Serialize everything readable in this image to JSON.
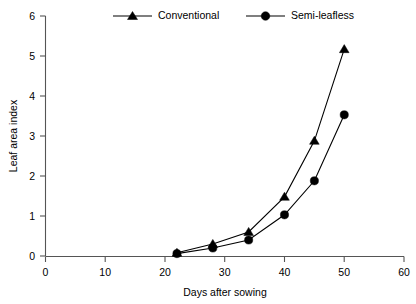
{
  "chart_data": {
    "type": "line",
    "title": "",
    "xlabel": "Days after sowing",
    "ylabel": "Leaf area index",
    "xlim": [
      0,
      60
    ],
    "ylim": [
      0,
      6
    ],
    "xticks": [
      0,
      10,
      20,
      30,
      40,
      50,
      60
    ],
    "yticks": [
      0,
      1,
      2,
      3,
      4,
      5,
      6
    ],
    "xtick_labels": [
      "0",
      "10",
      "20",
      "30",
      "40",
      "50",
      "60"
    ],
    "ytick_labels": [
      "0",
      "1",
      "2",
      "3",
      "4",
      "5",
      "6"
    ],
    "grid": false,
    "legend_position": "top",
    "x": [
      22,
      28,
      34,
      40,
      45,
      50
    ],
    "series": [
      {
        "name": "Conventional",
        "marker": "triangle",
        "color": "#000000",
        "values": [
          0.08,
          0.3,
          0.6,
          1.48,
          2.88,
          5.17
        ]
      },
      {
        "name": "Semi-leafless",
        "marker": "circle",
        "color": "#000000",
        "values": [
          0.06,
          0.2,
          0.4,
          1.03,
          1.88,
          3.53
        ]
      }
    ]
  },
  "legend": {
    "entries": [
      {
        "label": "Conventional",
        "marker": "triangle-marker-icon"
      },
      {
        "label": "Semi-leafless",
        "marker": "circle-marker-icon"
      }
    ]
  },
  "axes": {
    "x_title": "Days after sowing",
    "y_title": "Leaf area index"
  }
}
